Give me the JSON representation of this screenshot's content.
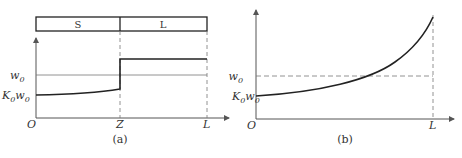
{
  "panel_a": {
    "caption": "(a)",
    "bar_regions": [
      {
        "label": "S"
      },
      {
        "label": "L"
      }
    ],
    "y_labels": {
      "w0": {
        "base": "w",
        "sub": "0"
      },
      "k0w0": {
        "base1": "K",
        "sub1": "0",
        "base2": "w",
        "sub2": "0"
      }
    },
    "x_labels": {
      "origin": "O",
      "z": "Z",
      "l": "L"
    }
  },
  "panel_b": {
    "caption": "(b)",
    "y_labels": {
      "w0": {
        "base": "w",
        "sub": "0"
      },
      "k0w0": {
        "base1": "K",
        "sub1": "0",
        "base2": "w",
        "sub2": "0"
      }
    },
    "x_labels": {
      "origin": "O",
      "l": "L"
    }
  },
  "colors": {
    "line": "#222222",
    "axis": "#555555",
    "dashed": "#777777"
  }
}
